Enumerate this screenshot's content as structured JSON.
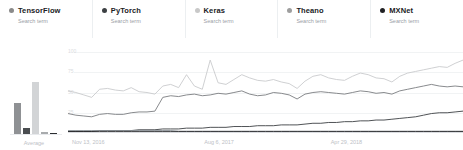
{
  "legend": {
    "subtitle_label": "Search term",
    "items": [
      {
        "name": "TensorFlow",
        "sublabel": "Search term",
        "color": "#8a8a8a"
      },
      {
        "name": "PyTorch",
        "sublabel": "Search term",
        "color": "#3c4043"
      },
      {
        "name": "Keras",
        "sublabel": "Search term",
        "color": "#c8c8c8"
      },
      {
        "name": "Theano",
        "sublabel": "Search term",
        "color": "#9e9e9e"
      },
      {
        "name": "MXNet",
        "sublabel": "Search term",
        "color": "#202124"
      }
    ]
  },
  "average_panel": {
    "label": "Average",
    "bars": [
      {
        "name": "TensorFlow",
        "value": 46,
        "color": "#8f9194"
      },
      {
        "name": "PyTorch",
        "value": 9,
        "color": "#4a4d50"
      },
      {
        "name": "Keras",
        "value": 76,
        "color": "#d2d4d6"
      },
      {
        "name": "Theano",
        "value": 3,
        "color": "#a8abad"
      },
      {
        "name": "MXNet",
        "value": 2,
        "color": "#2b2d30"
      }
    ]
  },
  "chart_data": {
    "type": "line",
    "title": "",
    "xlabel": "",
    "ylabel": "",
    "ylim": [
      0,
      100
    ],
    "yticks": [
      100,
      75,
      50,
      25
    ],
    "grid": true,
    "legend_position": "top",
    "xticks": [
      "Nov 13, 2016",
      "Aug 6, 2017",
      "Apr 29, 2018"
    ],
    "xtick_positions_pct": [
      1,
      34.5,
      66.5
    ],
    "x": [
      "2016-11-13",
      "2016-11-27",
      "2016-12-11",
      "2016-12-25",
      "2017-01-08",
      "2017-01-22",
      "2017-02-05",
      "2017-02-19",
      "2017-03-05",
      "2017-03-19",
      "2017-04-02",
      "2017-04-16",
      "2017-04-30",
      "2017-05-14",
      "2017-05-28",
      "2017-06-11",
      "2017-06-25",
      "2017-07-09",
      "2017-07-23",
      "2017-08-06",
      "2017-08-20",
      "2017-09-03",
      "2017-09-17",
      "2017-10-01",
      "2017-10-15",
      "2017-10-29",
      "2017-11-12",
      "2017-11-26",
      "2017-12-10",
      "2017-12-24",
      "2018-01-07",
      "2018-01-21",
      "2018-02-04",
      "2018-02-18",
      "2018-03-04",
      "2018-03-18",
      "2018-04-01",
      "2018-04-15",
      "2018-04-29",
      "2018-05-13",
      "2018-05-27",
      "2018-06-10",
      "2018-06-24",
      "2018-07-08",
      "2018-07-22",
      "2018-08-05",
      "2018-08-19",
      "2018-09-02",
      "2018-09-16",
      "2018-09-30",
      "2018-10-14"
    ],
    "series": [
      {
        "name": "TensorFlow",
        "color": "#c9cbcd",
        "values": [
          52,
          50,
          47,
          44,
          54,
          55,
          53,
          52,
          56,
          51,
          50,
          48,
          58,
          60,
          56,
          72,
          58,
          54,
          90,
          62,
          60,
          66,
          72,
          68,
          65,
          64,
          66,
          63,
          61,
          55,
          64,
          70,
          72,
          68,
          66,
          65,
          70,
          74,
          72,
          68,
          67,
          63,
          70,
          74,
          76,
          78,
          80,
          82,
          81,
          86,
          90
        ]
      },
      {
        "name": "Keras",
        "color": "#7b7d80",
        "values": [
          24,
          22,
          21,
          20,
          23,
          24,
          23,
          23,
          25,
          26,
          26,
          27,
          44,
          46,
          45,
          47,
          48,
          46,
          47,
          49,
          48,
          50,
          52,
          48,
          46,
          47,
          50,
          49,
          47,
          42,
          48,
          50,
          51,
          50,
          49,
          48,
          50,
          52,
          51,
          49,
          50,
          48,
          52,
          54,
          56,
          58,
          60,
          58,
          57,
          58,
          57
        ]
      },
      {
        "name": "PyTorch",
        "color": "#3c4043",
        "values": [
          2,
          2,
          2,
          2,
          3,
          3,
          3,
          3,
          3,
          4,
          4,
          4,
          5,
          5,
          5,
          6,
          6,
          6,
          7,
          7,
          7,
          8,
          8,
          8,
          9,
          9,
          9,
          10,
          10,
          10,
          11,
          12,
          12,
          13,
          13,
          14,
          14,
          15,
          15,
          16,
          16,
          17,
          18,
          19,
          20,
          22,
          24,
          25,
          25,
          26,
          27
        ]
      },
      {
        "name": "Theano",
        "color": "#9aa0a6",
        "values": [
          3,
          3,
          3,
          3,
          3,
          3,
          3,
          3,
          3,
          3,
          3,
          3,
          3,
          3,
          2,
          2,
          2,
          2,
          2,
          2,
          2,
          2,
          2,
          2,
          2,
          2,
          2,
          2,
          2,
          2,
          2,
          2,
          2,
          2,
          2,
          2,
          2,
          2,
          2,
          2,
          2,
          2,
          2,
          2,
          2,
          2,
          2,
          2,
          2,
          2,
          2
        ]
      },
      {
        "name": "MXNet",
        "color": "#202124",
        "values": [
          2,
          2,
          2,
          2,
          2,
          2,
          2,
          2,
          2,
          2,
          2,
          2,
          2,
          2,
          2,
          2,
          2,
          2,
          2,
          2,
          2,
          2,
          2,
          2,
          2,
          2,
          2,
          2,
          2,
          2,
          2,
          2,
          2,
          2,
          2,
          2,
          2,
          2,
          2,
          2,
          2,
          2,
          2,
          2,
          2,
          2,
          2,
          2,
          2,
          2,
          2
        ]
      }
    ]
  }
}
